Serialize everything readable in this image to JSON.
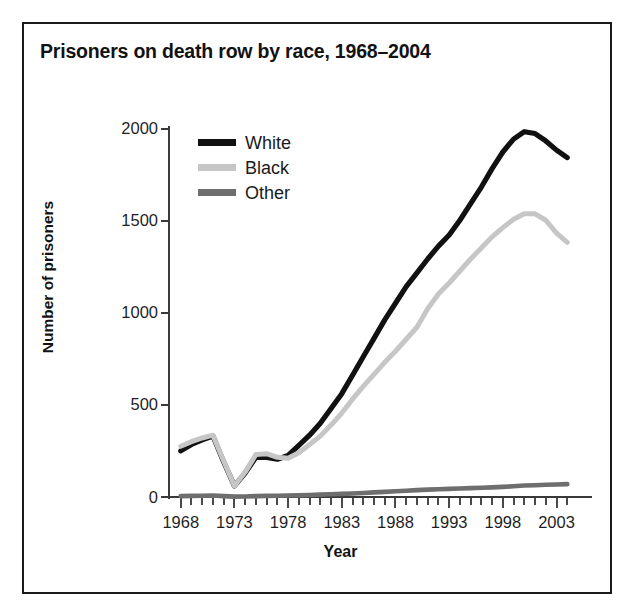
{
  "figure": {
    "title": "Prisoners on death row by race, 1968–2004",
    "frame_color": "#1a1a1a",
    "background": "#ffffff"
  },
  "axes": {
    "x_title": "Year",
    "y_title": "Number of prisoners",
    "y_ticks": [
      "0",
      "500",
      "1000",
      "1500",
      "2000"
    ],
    "x_ticks": [
      "1968",
      "1973",
      "1978",
      "1983",
      "1988",
      "1993",
      "1998",
      "2003"
    ]
  },
  "legend": {
    "position": "top-left-inside",
    "items": [
      {
        "label": "White",
        "color": "#111111"
      },
      {
        "label": "Black",
        "color": "#c6c6c6"
      },
      {
        "label": "Other",
        "color": "#6e6e6e"
      }
    ]
  },
  "chart_data": {
    "type": "line",
    "title": "Prisoners on death row by race, 1968–2004",
    "xlabel": "Year",
    "ylabel": "Number of prisoners",
    "xlim": [
      1967,
      2005
    ],
    "ylim": [
      0,
      2000
    ],
    "grid": false,
    "legend_position": "upper left",
    "x": [
      1968,
      1969,
      1970,
      1971,
      1972,
      1973,
      1974,
      1975,
      1976,
      1977,
      1978,
      1979,
      1980,
      1981,
      1982,
      1983,
      1984,
      1985,
      1986,
      1987,
      1988,
      1989,
      1990,
      1991,
      1992,
      1993,
      1994,
      1995,
      1996,
      1997,
      1998,
      1999,
      2000,
      2001,
      2002,
      2003,
      2004
    ],
    "series": [
      {
        "name": "White",
        "color": "#111111",
        "values": [
          250,
          285,
          310,
          330,
          190,
          60,
          130,
          215,
          215,
          205,
          225,
          280,
          335,
          400,
          480,
          560,
          660,
          760,
          860,
          960,
          1050,
          1140,
          1215,
          1290,
          1360,
          1420,
          1500,
          1590,
          1680,
          1780,
          1870,
          1940,
          1980,
          1970,
          1930,
          1880,
          1840
        ]
      },
      {
        "name": "Black",
        "color": "#c6c6c6",
        "values": [
          275,
          300,
          320,
          335,
          195,
          60,
          135,
          230,
          235,
          215,
          210,
          240,
          285,
          330,
          390,
          455,
          530,
          600,
          665,
          730,
          790,
          855,
          920,
          1020,
          1100,
          1160,
          1225,
          1290,
          1350,
          1410,
          1460,
          1505,
          1535,
          1535,
          1500,
          1430,
          1380
        ]
      },
      {
        "name": "Other",
        "color": "#6e6e6e",
        "values": [
          5,
          6,
          7,
          8,
          5,
          2,
          3,
          5,
          6,
          7,
          8,
          9,
          11,
          13,
          15,
          17,
          19,
          22,
          25,
          28,
          31,
          34,
          37,
          40,
          42,
          44,
          46,
          48,
          50,
          52,
          55,
          58,
          62,
          64,
          66,
          68,
          70
        ]
      }
    ]
  }
}
